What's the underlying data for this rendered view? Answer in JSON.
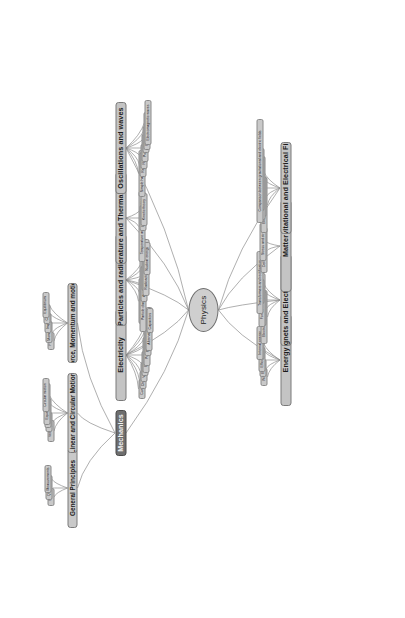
{
  "diagram": {
    "title": "Physics",
    "type": "mind-map",
    "root": {
      "label": "Physics",
      "shape": "ellipse"
    },
    "colors": {
      "node_fill": "#c9c9c9",
      "node_border": "#7a7a7a",
      "selected_fill": "#6e6e6e",
      "selected_text": "#f2f2f2",
      "edge": "#8c8c8c",
      "background": "#ffffff",
      "text": "#1b1b1b"
    },
    "branches": [
      {
        "label": "Mechanics",
        "selected": true,
        "children": [
          {
            "label": "General Principles",
            "children": [
              {
                "label": "Units"
              },
              {
                "label": "Quantities"
              },
              {
                "label": "Measurements"
              }
            ]
          },
          {
            "label": "Linear and Circular Motion",
            "children": [
              {
                "label": "Velocity"
              },
              {
                "label": "Scalars"
              },
              {
                "label": "Linear motion"
              },
              {
                "label": "Equations of motion"
              },
              {
                "label": "Circular motion"
              }
            ]
          },
          {
            "label": "Force, Momentum and motion",
            "children": [
              {
                "label": "Force"
              },
              {
                "label": "Momentum"
              },
              {
                "label": "Impulse"
              },
              {
                "label": "Couples"
              },
              {
                "label": "Equilibrium"
              }
            ]
          }
        ]
      },
      {
        "label": "Electricity",
        "selected": false,
        "children": [
          {
            "label": "Current"
          },
          {
            "label": "Charge"
          },
          {
            "label": "Voltage"
          },
          {
            "label": "Resistance"
          },
          {
            "label": "Electricity Laws"
          },
          {
            "label": "Potential divider"
          },
          {
            "label": "Power and energy"
          },
          {
            "label": "Alternating currents"
          },
          {
            "label": "Capacitors"
          }
        ]
      },
      {
        "label": "Particles and radioactivity",
        "selected": false,
        "children": [
          {
            "label": "Matter and Antimatter"
          },
          {
            "label": "Particle classification & interactions"
          },
          {
            "label": "Atomic structure"
          },
          {
            "label": "Radioactivity"
          },
          {
            "label": "Radioactive decay equations"
          },
          {
            "label": "Nuclear energy"
          }
        ]
      },
      {
        "label": "Temperature and Thermal Properties",
        "selected": false,
        "children": [
          {
            "label": "Temperature and thermal properties"
          },
          {
            "label": "Ideal gases"
          },
          {
            "label": "Kinetic theory"
          }
        ]
      },
      {
        "label": "Oscillations and waves",
        "selected": false,
        "children": [
          {
            "label": "Simple harmonic motion"
          },
          {
            "label": "Reflection"
          },
          {
            "label": "Refraction"
          },
          {
            "label": "Polarisation"
          },
          {
            "label": "Diffraction"
          },
          {
            "label": "Progressive waves"
          },
          {
            "label": "Electromagnetic waves"
          }
        ]
      },
      {
        "label": "Energy",
        "selected": false,
        "children": [
          {
            "label": "Work"
          },
          {
            "label": "Energy"
          },
          {
            "label": "Efficiency"
          },
          {
            "label": "Power"
          },
          {
            "label": "Internal energy"
          }
        ]
      },
      {
        "label": "Magnets and Electromagnetism",
        "selected": false,
        "children": [
          {
            "label": "Electromagnetic induction"
          },
          {
            "label": "Magnetic fields"
          },
          {
            "label": "Forces in magnetic fields"
          },
          {
            "label": "Lenz's law"
          },
          {
            "label": "Transformers and rectification"
          }
        ]
      },
      {
        "label": "Matter",
        "selected": false,
        "children": [
          {
            "label": "Deformation of Solids"
          },
          {
            "label": "Stress and strain"
          }
        ]
      },
      {
        "label": "Gravitational and Electrical Fields",
        "selected": false,
        "children": [
          {
            "label": "Electric fields and forces"
          },
          {
            "label": "Electric Potential"
          },
          {
            "label": "Gravitational fields and forces"
          },
          {
            "label": "Gravitational potential energy"
          },
          {
            "label": "Comparison between gravitational and electric fields"
          }
        ]
      }
    ]
  }
}
